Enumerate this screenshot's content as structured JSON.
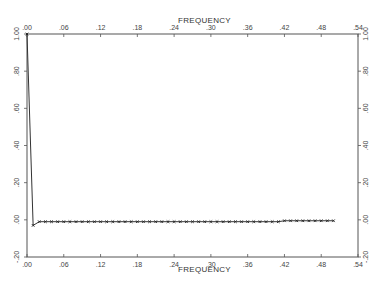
{
  "chart_data": {
    "type": "line",
    "title": "",
    "xlabel": "FREQUENCY",
    "xlabel_top": "FREQUENCY",
    "ylabel": "",
    "xlim": [
      0.0,
      0.54
    ],
    "ylim": [
      -0.2,
      1.0
    ],
    "grid": false,
    "legend": null,
    "x_ticks": [
      ".00",
      ".06",
      ".12",
      ".18",
      ".24",
      ".30",
      ".36",
      ".42",
      ".48",
      ".54"
    ],
    "x_tick_values": [
      0.0,
      0.06,
      0.12,
      0.18,
      0.24,
      0.3,
      0.36,
      0.42,
      0.48,
      0.54
    ],
    "y_ticks": [
      "1.00",
      ".80",
      ".60",
      ".40",
      ".20",
      ".00",
      "-.20"
    ],
    "y_tick_values": [
      1.0,
      0.8,
      0.6,
      0.4,
      0.2,
      0.0,
      -0.2
    ],
    "series": [
      {
        "name": "spectrum",
        "marker": "x",
        "x": [
          0.0,
          0.01,
          0.02,
          0.03,
          0.04,
          0.05,
          0.06,
          0.07,
          0.08,
          0.09,
          0.1,
          0.11,
          0.12,
          0.13,
          0.14,
          0.15,
          0.16,
          0.17,
          0.18,
          0.19,
          0.2,
          0.21,
          0.22,
          0.23,
          0.24,
          0.25,
          0.26,
          0.27,
          0.28,
          0.29,
          0.3,
          0.31,
          0.32,
          0.33,
          0.34,
          0.35,
          0.36,
          0.37,
          0.38,
          0.39,
          0.4,
          0.41,
          0.42,
          0.43,
          0.44,
          0.45,
          0.46,
          0.47,
          0.48,
          0.49,
          0.5
        ],
        "values": [
          1.0,
          -0.03,
          -0.01,
          -0.01,
          -0.01,
          -0.01,
          -0.01,
          -0.01,
          -0.01,
          -0.01,
          -0.01,
          -0.01,
          -0.01,
          -0.01,
          -0.01,
          -0.01,
          -0.01,
          -0.01,
          -0.01,
          -0.01,
          -0.01,
          -0.01,
          -0.01,
          -0.01,
          -0.01,
          -0.01,
          -0.01,
          -0.01,
          -0.01,
          -0.01,
          -0.01,
          -0.01,
          -0.01,
          -0.01,
          -0.01,
          -0.01,
          -0.01,
          -0.01,
          -0.01,
          -0.01,
          -0.01,
          -0.01,
          -0.005,
          -0.005,
          -0.005,
          -0.005,
          -0.005,
          -0.005,
          -0.005,
          -0.005,
          -0.005
        ]
      }
    ]
  }
}
